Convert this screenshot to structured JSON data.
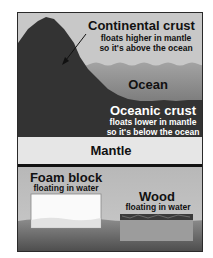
{
  "diagram": {
    "continental": {
      "title": "Continental crust",
      "line1": "floats higher in mantle",
      "line2": "so it's above the ocean"
    },
    "ocean": {
      "title": "Ocean"
    },
    "oceanic": {
      "title": "Oceanic crust",
      "line1": "floats lower in mantle",
      "line2": "so it's below the ocean"
    },
    "mantle": {
      "title": "Mantle"
    },
    "foam": {
      "title": "Foam block",
      "sub": "floating in water"
    },
    "wood": {
      "title": "Wood",
      "sub": "floating in water"
    }
  },
  "colors": {
    "sky": "#c8c8c8",
    "ocean_top": "#9a9a9a",
    "ocean_bottom": "#5e5e5e",
    "crust": "#333333",
    "mantle": "#e6e6e6",
    "divider": "#111111",
    "water_top": "#8a8a8a",
    "water_bottom": "#4e4e4e",
    "tank_air": "#bdbdbd",
    "foam": "#fafafa",
    "wood_top": "#3a3a3a",
    "wood_body": "#9c9c9c"
  }
}
